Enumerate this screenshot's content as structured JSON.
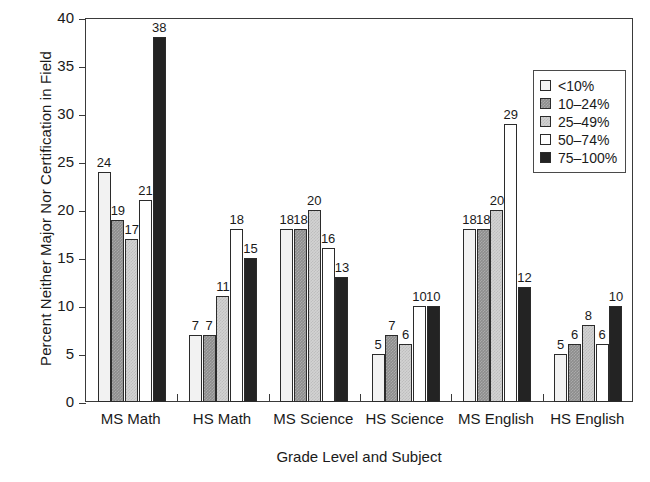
{
  "chart_data": {
    "type": "bar",
    "title": "",
    "xlabel": "Grade Level and Subject",
    "ylabel": "Percent Neither Major Nor Certification in Field",
    "ylim": [
      0,
      40
    ],
    "yticks": [
      0,
      5,
      10,
      15,
      20,
      25,
      30,
      35,
      40
    ],
    "grid": false,
    "legend_position": "top-right",
    "legend_title": "",
    "categories": [
      "MS Math",
      "HS Math",
      "MS Science",
      "HS Science",
      "MS English",
      "HS English"
    ],
    "series": [
      {
        "name": "<10%",
        "color": "#f2f2f2",
        "values": [
          24,
          7,
          18,
          5,
          18,
          5
        ]
      },
      {
        "name": "10–24%",
        "color": "#8d8d8d",
        "values": [
          19,
          7,
          18,
          7,
          18,
          6
        ]
      },
      {
        "name": "25–49%",
        "color": "#d2d2d2",
        "values": [
          17,
          11,
          20,
          6,
          20,
          8
        ]
      },
      {
        "name": "50–74%",
        "color": "#ffffff",
        "values": [
          21,
          18,
          16,
          10,
          29,
          6
        ]
      },
      {
        "name": "75–100%",
        "color": "#232323",
        "values": [
          38,
          15,
          13,
          10,
          12,
          10
        ]
      }
    ]
  },
  "legend": {
    "items": [
      {
        "label": "<10%"
      },
      {
        "label": "10–24%"
      },
      {
        "label": "25–49%"
      },
      {
        "label": "50–74%"
      },
      {
        "label": "75–100%"
      }
    ]
  },
  "axes": {
    "y_title": "Percent Neither Major Nor Certification in Field",
    "x_title": "Grade Level and Subject",
    "y_tick_labels": [
      "0",
      "5",
      "10",
      "15",
      "20",
      "25",
      "30",
      "35",
      "40"
    ]
  }
}
